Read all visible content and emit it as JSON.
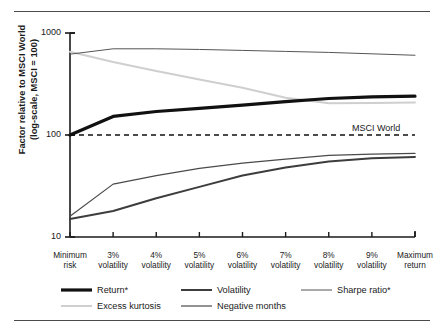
{
  "chart_data": {
    "type": "line",
    "title": "",
    "xlabel": "",
    "ylabel": "Factor relative to MSCI World (log-scale, MSCI = 100)",
    "ylabel_lines": [
      "Factor relative to MSCI World",
      "(log-scale, MSCI = 100)"
    ],
    "yscale": "log",
    "ylim": [
      10,
      1000
    ],
    "yticks": [
      10,
      100,
      1000
    ],
    "ytick_labels": [
      "10",
      "100",
      "1000"
    ],
    "grid": false,
    "legend_position": "below",
    "categories": [
      "Minimum risk",
      "3% volatility",
      "4% volatility",
      "5% volatility",
      "6% volatility",
      "7% volatility",
      "8% volatility",
      "9% volatility",
      "Maximum return"
    ],
    "category_lines": [
      [
        "Minimum",
        "risk"
      ],
      [
        "3%",
        "volatility"
      ],
      [
        "4%",
        "volatility"
      ],
      [
        "5%",
        "volatility"
      ],
      [
        "6%",
        "volatility"
      ],
      [
        "7%",
        "volatility"
      ],
      [
        "8%",
        "volatility"
      ],
      [
        "9%",
        "volatility"
      ],
      [
        "Maximum",
        "return"
      ]
    ],
    "series": [
      {
        "name": "Return*",
        "color": "#111111",
        "width": 3.2,
        "values": [
          100,
          152,
          170,
          182,
          196,
          212,
          228,
          236,
          240
        ]
      },
      {
        "name": "Volatility",
        "color": "#3d3d3d",
        "width": 2.0,
        "values": [
          15,
          18,
          24,
          31,
          40,
          48,
          55,
          59,
          61
        ]
      },
      {
        "name": "Sharpe ratio*",
        "color": "#555555",
        "width": 1.0,
        "values": [
          620,
          700,
          700,
          690,
          675,
          660,
          645,
          625,
          605
        ]
      },
      {
        "name": "Excess kurtosis",
        "color": "#cfcfcf",
        "width": 2.0,
        "values": [
          655,
          520,
          425,
          350,
          290,
          232,
          205,
          206,
          208
        ]
      },
      {
        "name": "Negative months",
        "color": "#4a4a4a",
        "width": 1.2,
        "values": [
          16,
          33,
          40,
          47,
          53,
          58,
          63,
          65,
          66
        ]
      }
    ],
    "reference_line": {
      "label": "MSCI World",
      "value": 100,
      "style": "dashed",
      "color": "#111111"
    }
  },
  "legend": {
    "items": [
      {
        "label": "Return*",
        "key": "return"
      },
      {
        "label": "Volatility",
        "key": "volatility"
      },
      {
        "label": "Sharpe ratio*",
        "key": "sharpe-ratio"
      },
      {
        "label": "Excess kurtosis",
        "key": "excess-kurtosis"
      },
      {
        "label": "Negative months",
        "key": "negative-months"
      }
    ]
  }
}
